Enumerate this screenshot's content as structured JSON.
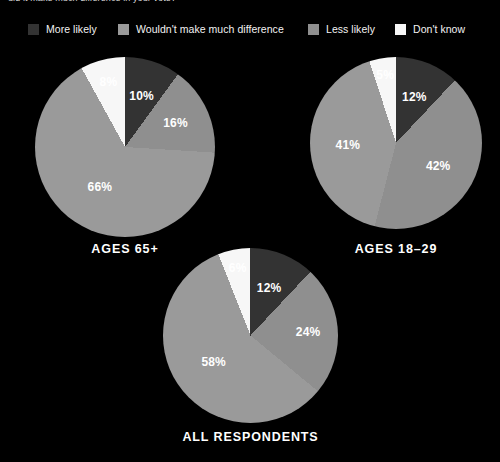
{
  "headline": "uld it make much difference in your vote?",
  "colors": {
    "background": "#000000",
    "text": "#ffffff",
    "more_likely": "#333333",
    "wouldnt_make_much_difference": "#9a9a9a",
    "less_likely": "#8f8f8f",
    "dont_know": "#f7f7f7"
  },
  "legend": {
    "items": [
      {
        "label": "More likely",
        "color": "#333333",
        "x": 28
      },
      {
        "label": "Wouldn't make much difference",
        "color": "#9a9a9a",
        "x": 118
      },
      {
        "label": "Less likely",
        "color": "#8f8f8f",
        "x": 308
      },
      {
        "label": "Don't know",
        "color": "#f7f7f7",
        "x": 395
      }
    ]
  },
  "chart_data": [
    {
      "type": "pie",
      "title": "AGES 65+",
      "categories": [
        "More likely",
        "Wouldn't make much difference",
        "Less likely",
        "Don't know"
      ],
      "values": [
        10,
        66,
        16,
        8
      ],
      "slice_order": [
        "More likely",
        "Less likely",
        "Wouldn't make much difference",
        "Don't know"
      ],
      "slices": [
        {
          "label": "More likely",
          "value": 10,
          "display": "10%",
          "color": "#333333",
          "label_color": "#ffffff",
          "label_radius": 0.6
        },
        {
          "label": "Less likely",
          "value": 16,
          "display": "16%",
          "color": "#8f8f8f",
          "label_color": "#ffffff",
          "label_radius": 0.62
        },
        {
          "label": "Wouldn't make much difference",
          "value": 66,
          "display": "66%",
          "color": "#9a9a9a",
          "label_color": "#ffffff",
          "label_radius": 0.52
        },
        {
          "label": "Don't know",
          "value": 8,
          "display": "8%",
          "color": "#f7f7f7",
          "label_color": "#ffffff",
          "label_radius": 0.74
        }
      ],
      "geometry": {
        "left": 35,
        "top": 57,
        "size": 180,
        "caption_top": 242
      }
    },
    {
      "type": "pie",
      "title": "AGES 18–29",
      "categories": [
        "More likely",
        "Wouldn't make much difference",
        "Less likely",
        "Don't know"
      ],
      "values": [
        12,
        41,
        42,
        5
      ],
      "slice_order": [
        "More likely",
        "Less likely",
        "Wouldn't make much difference",
        "Don't know"
      ],
      "slices": [
        {
          "label": "More likely",
          "value": 12,
          "display": "12%",
          "color": "#333333",
          "label_color": "#ffffff",
          "label_radius": 0.58
        },
        {
          "label": "Less likely",
          "value": 42,
          "display": "42%",
          "color": "#8f8f8f",
          "label_color": "#ffffff",
          "label_radius": 0.56
        },
        {
          "label": "Wouldn't make much difference",
          "value": 41,
          "display": "41%",
          "color": "#9a9a9a",
          "label_color": "#ffffff",
          "label_radius": 0.56
        },
        {
          "label": "Don't know",
          "value": 5,
          "display": "5%",
          "color": "#f7f7f7",
          "label_color": "#ffffff",
          "label_radius": 0.8
        }
      ],
      "geometry": {
        "left": 310,
        "top": 57,
        "size": 172,
        "caption_top": 242
      }
    },
    {
      "type": "pie",
      "title": "ALL RESPONDENTS",
      "categories": [
        "More likely",
        "Wouldn't make much difference",
        "Less likely",
        "Don't know"
      ],
      "values": [
        12,
        58,
        24,
        6
      ],
      "slice_order": [
        "More likely",
        "Less likely",
        "Wouldn't make much difference",
        "Don't know"
      ],
      "slices": [
        {
          "label": "More likely",
          "value": 12,
          "display": "12%",
          "color": "#333333",
          "label_color": "#ffffff",
          "label_radius": 0.58
        },
        {
          "label": "Less likely",
          "value": 24,
          "display": "24%",
          "color": "#8f8f8f",
          "label_color": "#ffffff",
          "label_radius": 0.66
        },
        {
          "label": "Wouldn't make much difference",
          "value": 58,
          "display": "58%",
          "color": "#9a9a9a",
          "label_color": "#ffffff",
          "label_radius": 0.52
        },
        {
          "label": "Don't know",
          "value": 6,
          "display": "6%",
          "color": "#f7f7f7",
          "label_color": "#ffffff",
          "label_radius": 0.78
        }
      ],
      "geometry": {
        "left": 163,
        "top": 248,
        "size": 175,
        "caption_top": 430
      }
    }
  ]
}
